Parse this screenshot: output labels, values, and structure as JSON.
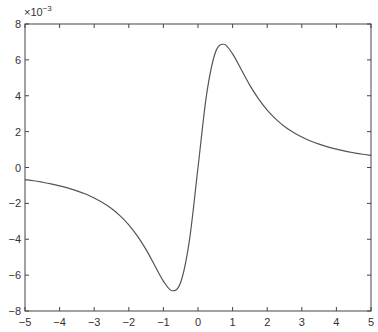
{
  "chart_data": {
    "type": "line",
    "title": "",
    "xlabel": "",
    "ylabel": "",
    "y_multiplier_label": "×10",
    "y_multiplier_exponent": "−3",
    "xlim": [
      -5,
      5
    ],
    "ylim": [
      -8,
      8
    ],
    "y_scale_factor": 0.001,
    "grid": false,
    "legend": null,
    "x_ticks": [
      -5,
      -4,
      -3,
      -2,
      -1,
      0,
      1,
      2,
      3,
      4,
      5
    ],
    "x_tick_labels": [
      "−5",
      "−4",
      "−3",
      "−2",
      "−1",
      "0",
      "1",
      "2",
      "3",
      "4",
      "5"
    ],
    "y_ticks": [
      -8,
      -6,
      -4,
      -2,
      0,
      2,
      4,
      6,
      8
    ],
    "y_tick_labels": [
      "−8",
      "−6",
      "−4",
      "−2",
      "0",
      "2",
      "4",
      "6",
      "8"
    ],
    "series": [
      {
        "name": "curve",
        "color": "#555555",
        "x": [
          -5,
          -4.75,
          -4.5,
          -4.25,
          -4,
          -3.75,
          -3.5,
          -3.25,
          -3,
          -2.75,
          -2.5,
          -2.25,
          -2,
          -1.75,
          -1.5,
          -1.25,
          -1,
          -0.75,
          -0.5,
          -0.25,
          0,
          0.25,
          0.5,
          0.75,
          1,
          1.25,
          1.5,
          1.75,
          2,
          2.25,
          2.5,
          2.75,
          3,
          3.25,
          3.5,
          3.75,
          4,
          4.25,
          4.5,
          4.75,
          5
        ],
        "y": [
          -0.68,
          -0.74,
          -0.82,
          -0.91,
          -1.02,
          -1.15,
          -1.3,
          -1.48,
          -1.7,
          -1.97,
          -2.29,
          -2.7,
          -3.2,
          -3.83,
          -4.58,
          -5.46,
          -6.33,
          -6.87,
          -6.4,
          -4.09,
          0,
          4.09,
          6.4,
          6.87,
          6.33,
          5.46,
          4.58,
          3.83,
          3.2,
          2.7,
          2.29,
          1.97,
          1.7,
          1.48,
          1.3,
          1.15,
          1.02,
          0.91,
          0.82,
          0.74,
          0.68
        ]
      }
    ]
  },
  "colors": {
    "axis": "#444444",
    "line": "#555555",
    "background": "#ffffff"
  }
}
